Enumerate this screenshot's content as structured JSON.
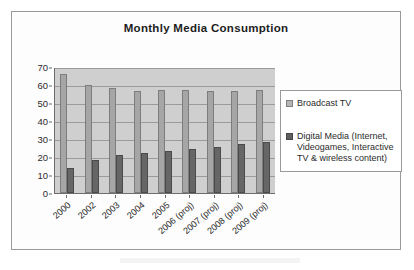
{
  "chart_data": {
    "type": "bar",
    "title": "Monthly Media Consumption",
    "xlabel": "",
    "ylabel": "",
    "ylim": [
      0,
      70
    ],
    "ytick_step": 10,
    "yticks": [
      "0",
      "10",
      "20",
      "30",
      "40",
      "50",
      "60",
      "70"
    ],
    "grid": true,
    "legend_position": "right",
    "categories": [
      "2000",
      "2002",
      "2003",
      "2004",
      "2005",
      "2006 (proj)",
      "2007 (proj)",
      "2008 (proj)",
      "2009 (proj)"
    ],
    "series": [
      {
        "name": "Broadcast TV",
        "color": "#a6a6a6",
        "values": [
          66,
          60,
          58.5,
          56.5,
          57,
          57.3,
          56.5,
          56.5,
          57
        ]
      },
      {
        "name": "Digital Media (Internet, Videogames, Interactive TV & wireless content)",
        "color": "#666666",
        "values": [
          14,
          18.5,
          21,
          22.3,
          23.5,
          24.5,
          25.5,
          27,
          28.3
        ]
      }
    ]
  },
  "legend": {
    "entries": [
      {
        "label": "Broadcast TV"
      },
      {
        "label": "Digital Media (Internet, Videogames, Interactive TV & wireless content)"
      }
    ]
  }
}
